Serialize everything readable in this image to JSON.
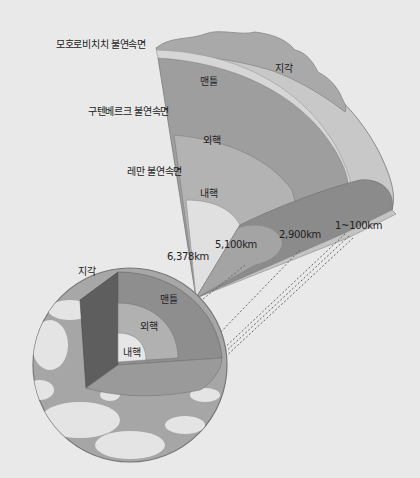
{
  "colors": {
    "background": "#e9e9e9",
    "crust": "#c9c9c9",
    "mantle": "#9d9d9d",
    "outer_core": "#b4b4b4",
    "inner_core": "#dedede",
    "mantle_dark": "#7c7c7c",
    "ocean": "#a8a8a8",
    "cloud": "#ececec"
  },
  "boundaries": {
    "moho": "모호로비치치 불연속면",
    "gutenberg": "구텐베르크 불연속면",
    "lehmann": "레만 불연속면"
  },
  "layers": {
    "crust": "지각",
    "mantle": "맨틀",
    "outer_core": "외핵",
    "inner_core": "내핵"
  },
  "depths": {
    "center": "6,378km",
    "inner_outer": "5,100km",
    "core_mantle": "2,900km",
    "crust": "1~100km"
  },
  "globe": {
    "crust_label": "지각",
    "mantle_label": "맨틀",
    "outer_core_label": "외핵",
    "inner_core_label": "내핵"
  }
}
